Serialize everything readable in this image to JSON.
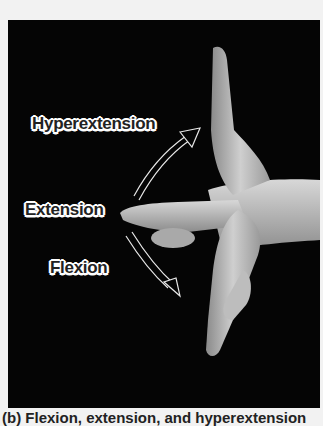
{
  "figure": {
    "background_color": "#050505",
    "labels": {
      "hyperextension": "Hyperextension",
      "extension": "Extension",
      "flexion": "Flexion"
    },
    "arrows": [
      {
        "name": "hyperextension-arrow",
        "direction": "up-right"
      },
      {
        "name": "flexion-arrow",
        "direction": "down-right"
      }
    ]
  },
  "caption": {
    "text": "(b) Flexion, extension, and hyperextension"
  }
}
